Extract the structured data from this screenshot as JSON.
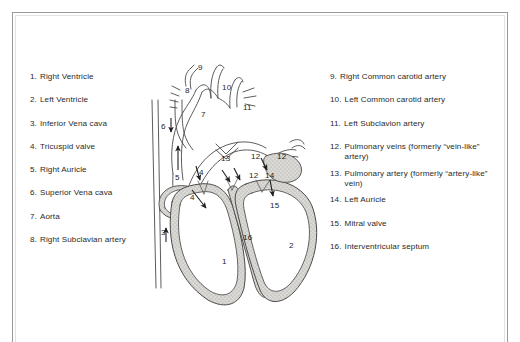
{
  "page": {
    "background_color": "#ffffff",
    "border_color": "#9a9a9a",
    "text_color": "#2a2a2a"
  },
  "legend_left": [
    {
      "num": "1.",
      "label": "Right Ventricle"
    },
    {
      "num": "2.",
      "label": "Left Ventricle"
    },
    {
      "num": "3.",
      "label": "Inferior Vena cava"
    },
    {
      "num": "4.",
      "label": "Tricuspid valve"
    },
    {
      "num": "5.",
      "label": "Right Auricle"
    },
    {
      "num": "6.",
      "label": "Superior Vena cava"
    },
    {
      "num": "7.",
      "label": "Aorta"
    },
    {
      "num": "8.",
      "label": "Right Subclavian artery"
    }
  ],
  "legend_right": [
    {
      "num": "9.",
      "label": "Right Common carotid artery"
    },
    {
      "num": "10.",
      "label": "Left Common carotid artery"
    },
    {
      "num": "11.",
      "label": "Left Subclavion artery"
    },
    {
      "num": "12.",
      "label": "Pulmonary veins (formerly “vein-like” artery)"
    },
    {
      "num": "13.",
      "label": "Pulmonary artery (formerly “artery-like” vein)"
    },
    {
      "num": "14.",
      "label": "Left Auricle"
    },
    {
      "num": "15.",
      "label": "Mitral valve"
    },
    {
      "num": "16.",
      "label": "Interventricular septum"
    }
  ],
  "figure_callouts": [
    {
      "id": "callout-1",
      "text": "1",
      "x": 92,
      "y": 219
    },
    {
      "id": "callout-2",
      "text": "2",
      "x": 159,
      "y": 203
    },
    {
      "id": "callout-3",
      "text": "3",
      "x": 31,
      "y": 190
    },
    {
      "id": "callout-4a",
      "text": "4",
      "x": 69,
      "y": 130
    },
    {
      "id": "callout-4b",
      "text": "4",
      "x": 60,
      "y": 155
    },
    {
      "id": "callout-5",
      "text": "5",
      "x": 45,
      "y": 135
    },
    {
      "id": "callout-6",
      "text": "6",
      "x": 31,
      "y": 84
    },
    {
      "id": "callout-7",
      "text": "7",
      "x": 71,
      "y": 72
    },
    {
      "id": "callout-8",
      "text": "8",
      "x": 55,
      "y": 48
    },
    {
      "id": "callout-9",
      "text": "9",
      "x": 68,
      "y": 25
    },
    {
      "id": "callout-10",
      "text": "10",
      "x": 92,
      "y": 45
    },
    {
      "id": "callout-11",
      "text": "11",
      "x": 113,
      "y": 65
    },
    {
      "id": "callout-12a",
      "text": "12",
      "x": 121,
      "y": 114
    },
    {
      "id": "callout-12b",
      "text": "12",
      "x": 147,
      "y": 114
    },
    {
      "id": "callout-12c",
      "text": "12",
      "x": 119,
      "y": 133
    },
    {
      "id": "callout-13",
      "text": "13",
      "x": 91,
      "y": 116
    },
    {
      "id": "callout-14",
      "text": "14",
      "x": 135,
      "y": 133
    },
    {
      "id": "callout-15",
      "text": "15",
      "x": 140,
      "y": 163
    },
    {
      "id": "callout-16",
      "text": "16",
      "x": 113,
      "y": 195
    }
  ],
  "figure_colors": {
    "outline": "#4a4a4a",
    "wall_fill": "#d8d6d2",
    "chamber_fill": "#ffffff",
    "arrow": "#1f1f1f"
  }
}
